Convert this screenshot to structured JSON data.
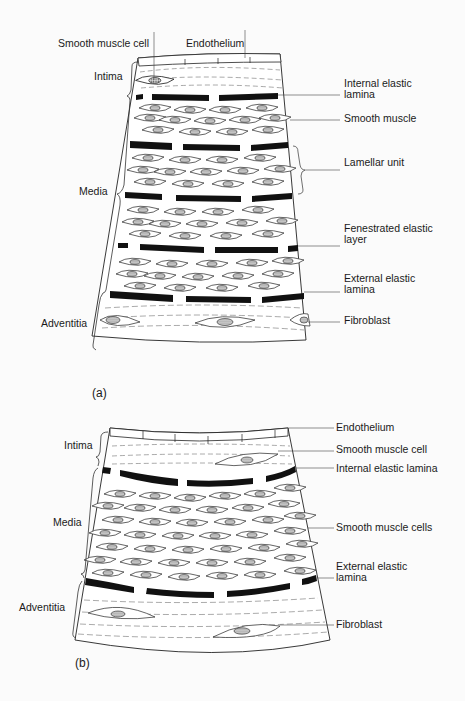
{
  "figure_a": {
    "panel_label": "(a)",
    "top_labels": {
      "smooth_muscle_cell": "Smooth muscle cell",
      "endothelium": "Endothelium"
    },
    "left_labels": {
      "intima": "Intima",
      "media": "Media",
      "adventitia": "Adventitia"
    },
    "right_labels": {
      "internal_elastic_lamina_1": "Internal elastic",
      "internal_elastic_lamina_2": "lamina",
      "smooth_muscle": "Smooth muscle",
      "lamellar_unit": "Lamellar unit",
      "fenestrated_1": "Fenestrated elastic",
      "fenestrated_2": "layer",
      "external_elastic_lamina_1": "External elastic",
      "external_elastic_lamina_2": "lamina",
      "fibroblast": "Fibroblast"
    }
  },
  "figure_b": {
    "panel_label": "(b)",
    "left_labels": {
      "intima": "Intima",
      "media": "Media",
      "adventitia": "Adventitia"
    },
    "right_labels": {
      "endothelium": "Endothelium",
      "smooth_muscle_cell": "Smooth muscle cell",
      "internal_elastic_lamina": "Internal elastic lamina",
      "smooth_muscle_cells": "Smooth muscle cells",
      "external_elastic_lamina_1": "External elastic",
      "external_elastic_lamina_2": "lamina",
      "fibroblast": "Fibroblast"
    }
  },
  "colors": {
    "ink": "#1a1a1a",
    "background": "#fbfbfb",
    "nucleus_fill": "#b5b5b5"
  }
}
